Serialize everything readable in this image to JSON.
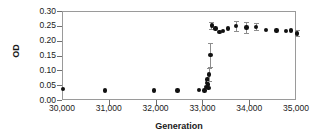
{
  "chart_data": {
    "type": "scatter",
    "title": "",
    "xlabel": "Generation",
    "ylabel": "OD",
    "xlim": [
      30000,
      35000
    ],
    "ylim": [
      0.0,
      0.3
    ],
    "xticks": [
      30000,
      31000,
      32000,
      33000,
      34000,
      35000
    ],
    "xtick_labels": [
      "30,000",
      "31,000",
      "32,000",
      "33,000",
      "34,000",
      "35,000"
    ],
    "yticks": [
      0.0,
      0.05,
      0.1,
      0.15,
      0.2,
      0.25,
      0.3
    ],
    "ytick_labels": [
      "0.00",
      "0.05",
      "0.10",
      "0.15",
      "0.20",
      "0.25",
      "0.30"
    ],
    "grid": false,
    "legend": false,
    "marker": "filled-circle",
    "marker_color": "#111111",
    "errorbar_color": "#8d8d8d",
    "frame_color": "#9a9a9a",
    "series": [
      {
        "name": "OD",
        "points": [
          {
            "x": 30000,
            "y": 0.04,
            "yerr": 0.0
          },
          {
            "x": 30900,
            "y": 0.035,
            "yerr": 0.0
          },
          {
            "x": 31950,
            "y": 0.035,
            "yerr": 0.0
          },
          {
            "x": 32450,
            "y": 0.035,
            "yerr": 0.0
          },
          {
            "x": 32900,
            "y": 0.038,
            "yerr": 0.0
          },
          {
            "x": 33020,
            "y": 0.035,
            "yerr": 0.0
          },
          {
            "x": 33060,
            "y": 0.048,
            "yerr": 0.0
          },
          {
            "x": 33080,
            "y": 0.06,
            "yerr": 0.0
          },
          {
            "x": 33090,
            "y": 0.072,
            "yerr": 0.0
          },
          {
            "x": 33100,
            "y": 0.055,
            "yerr": 0.0
          },
          {
            "x": 33110,
            "y": 0.043,
            "yerr": 0.0
          },
          {
            "x": 33120,
            "y": 0.09,
            "yerr": 0.022
          },
          {
            "x": 33150,
            "y": 0.155,
            "yerr": 0.04
          },
          {
            "x": 33180,
            "y": 0.255,
            "yerr": 0.012
          },
          {
            "x": 33260,
            "y": 0.245,
            "yerr": 0.0
          },
          {
            "x": 33340,
            "y": 0.232,
            "yerr": 0.0
          },
          {
            "x": 33420,
            "y": 0.236,
            "yerr": 0.0
          },
          {
            "x": 33520,
            "y": 0.244,
            "yerr": 0.0
          },
          {
            "x": 33700,
            "y": 0.252,
            "yerr": 0.016
          },
          {
            "x": 33920,
            "y": 0.248,
            "yerr": 0.018
          },
          {
            "x": 34130,
            "y": 0.25,
            "yerr": 0.012
          },
          {
            "x": 34340,
            "y": 0.24,
            "yerr": 0.0
          },
          {
            "x": 34560,
            "y": 0.238,
            "yerr": 0.0
          },
          {
            "x": 34760,
            "y": 0.236,
            "yerr": 0.0
          },
          {
            "x": 34870,
            "y": 0.238,
            "yerr": 0.0
          },
          {
            "x": 35000,
            "y": 0.228,
            "yerr": 0.01
          }
        ]
      }
    ]
  }
}
